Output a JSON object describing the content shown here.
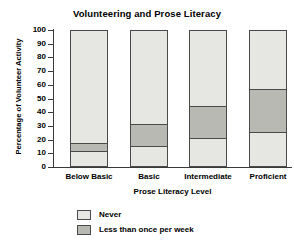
{
  "chart_data": {
    "type": "bar",
    "title": "Volunteering and Prose Literacy",
    "xlabel": "Prose Literacy Level",
    "ylabel": "Percentage of Volunteer Activity",
    "categories": [
      "Below Basic",
      "Basic",
      "Intermediate",
      "Proficient"
    ],
    "ylim": [
      0,
      100
    ],
    "yticks": [
      0,
      10,
      20,
      30,
      40,
      50,
      60,
      70,
      80,
      90,
      100
    ],
    "grid": false,
    "stacked": true,
    "legend_position": "bottom",
    "series": [
      {
        "name": "Never",
        "color": "#e6e6e2",
        "values": [
          10,
          14,
          20,
          24
        ]
      },
      {
        "name": "Less than once per week",
        "color": "#b9b9b4",
        "values": [
          7,
          17,
          24,
          32
        ]
      }
    ],
    "cumulative_boundaries": [
      {
        "category": "Below Basic",
        "never_top": 10,
        "less_than_once_top": 17,
        "bar_top": 100
      },
      {
        "category": "Basic",
        "never_top": 14,
        "less_than_once_top": 31,
        "bar_top": 100
      },
      {
        "category": "Intermediate",
        "never_top": 20,
        "less_than_once_top": 44,
        "bar_top": 100
      },
      {
        "category": "Proficient",
        "never_top": 24,
        "less_than_once_top": 56,
        "bar_top": 100
      }
    ]
  },
  "legend": {
    "items": [
      {
        "label": "Never",
        "color": "#e6e6e2"
      },
      {
        "label": "Less than once per week",
        "color": "#b9b9b4"
      }
    ]
  }
}
